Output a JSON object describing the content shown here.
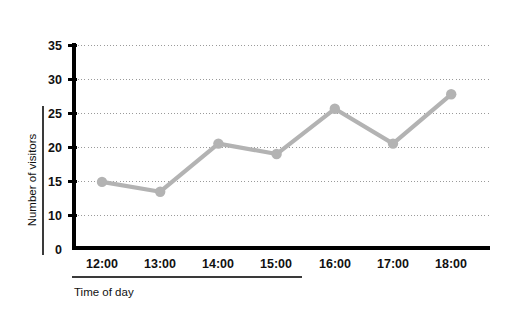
{
  "chart_data": {
    "type": "line",
    "title": "",
    "xlabel": "Time of day",
    "ylabel": "Number of visitors",
    "categories": [
      "12:00",
      "13:00",
      "14:00",
      "15:00",
      "16:00",
      "17:00",
      "18:00"
    ],
    "values": [
      11.4,
      9.7,
      18.0,
      16.2,
      24.0,
      18.0,
      26.5
    ],
    "series": [
      {
        "name": "Number of visitors",
        "values": [
          11.4,
          9.7,
          18.0,
          16.2,
          24.0,
          18.0,
          26.5
        ]
      }
    ],
    "ylim": [
      0,
      35
    ],
    "yticks": [
      0,
      10,
      15,
      20,
      25,
      30,
      35
    ],
    "ytick_labels": [
      "0",
      "10",
      "15",
      "20",
      "25",
      "30",
      "35"
    ],
    "gridlines": [
      10,
      15,
      20,
      25,
      30,
      35
    ],
    "grid": true,
    "legend": "none",
    "line_color": "#b3b3b3",
    "marker_color": "#b3b3b3",
    "grid_color": "#9a9a9a",
    "axis_color": "#000000"
  },
  "axis_titles": {
    "x": "Time of day",
    "y": "Number of visitors"
  }
}
